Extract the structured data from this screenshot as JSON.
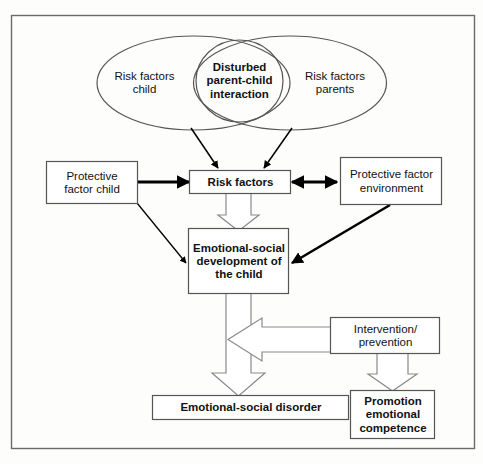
{
  "figure": {
    "type": "flow-diagram",
    "frame_color": "#6b6b6b",
    "shape_stroke": "#444444",
    "arrow_solid_color": "#000000",
    "arrow_hollow_stroke": "#8a8a8a",
    "background": "#fdfdfc"
  },
  "venn": {
    "left_ellipse": {
      "label": "Risk factors\nchild"
    },
    "right_ellipse": {
      "label": "Risk factors\nparents"
    },
    "center_circle": {
      "label": "Disturbed\nparent-child\ninteraction"
    }
  },
  "boxes": {
    "protective_child": {
      "label": "Protective\nfactor child"
    },
    "risk_factors": {
      "label": "Risk factors"
    },
    "protective_environment": {
      "label": "Protective factor\nenvironment"
    },
    "emotional_social_development": {
      "label": "Emotional-social\ndevelopment of\nthe child"
    },
    "intervention": {
      "label": "Intervention/\nprevention"
    },
    "emotional_social_disorder": {
      "label": "Emotional-social disorder"
    },
    "promotion": {
      "label": "Promotion\nemotional\ncompetence"
    }
  },
  "connections": [
    {
      "name": "left-ellipse-to-risk-factors",
      "style": "solid-arrow",
      "from": "left_ellipse",
      "to": "risk_factors"
    },
    {
      "name": "right-ellipse-to-risk-factors",
      "style": "solid-arrow",
      "from": "right_ellipse",
      "to": "risk_factors"
    },
    {
      "name": "protective-child-to-risk-factors",
      "style": "solid-arrow",
      "from": "protective_child",
      "to": "risk_factors"
    },
    {
      "name": "risk-factors-to-protective-environment",
      "style": "solid-double-arrow",
      "from": "risk_factors",
      "to": "protective_environment"
    },
    {
      "name": "risk-factors-to-development",
      "style": "hollow-block-arrow",
      "from": "risk_factors",
      "to": "emotional_social_development"
    },
    {
      "name": "protective-child-to-development",
      "style": "solid-arrow",
      "from": "protective_child",
      "to": "emotional_social_development"
    },
    {
      "name": "protective-environment-to-development",
      "style": "solid-arrow",
      "from": "protective_environment",
      "to": "emotional_social_development"
    },
    {
      "name": "development-to-disorder",
      "style": "hollow-block-arrow",
      "from": "emotional_social_development",
      "to": "emotional_social_disorder"
    },
    {
      "name": "intervention-to-development-path",
      "style": "hollow-block-arrow",
      "from": "intervention",
      "to": "development-disorder-path"
    },
    {
      "name": "intervention-to-promotion",
      "style": "hollow-block-arrow",
      "from": "intervention",
      "to": "promotion"
    }
  ]
}
